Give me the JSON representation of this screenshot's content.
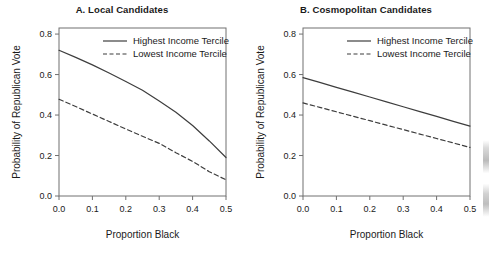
{
  "figure": {
    "panel_count": 2,
    "background_color": "#ffffff",
    "line_color": "#3d3d3d",
    "text_color": "#1a1a1a",
    "axis_color": "#707070"
  },
  "chart_data": [
    {
      "type": "line",
      "panel_label": "A",
      "title": "A. Local Candidates",
      "xlabel": "Proportion Black",
      "ylabel": "Probability of Republican Vote",
      "xlim": [
        0.0,
        0.5
      ],
      "ylim": [
        0.0,
        0.83
      ],
      "xticks": [
        0.0,
        0.1,
        0.2,
        0.3,
        0.4,
        0.5
      ],
      "xticklabels": [
        "0.0",
        "0.1",
        "0.2",
        "0.3",
        "0.4",
        "0.5"
      ],
      "yticks": [
        0.0,
        0.2,
        0.4,
        0.6,
        0.8
      ],
      "yticklabels": [
        "0.0",
        "0.2",
        "0.4",
        "0.6",
        "0.8"
      ],
      "grid": false,
      "legend_position": "top-right-inside",
      "x": [
        0.0,
        0.05,
        0.1,
        0.15,
        0.2,
        0.25,
        0.3,
        0.35,
        0.4,
        0.45,
        0.5
      ],
      "series": [
        {
          "name": "Highest Income Tercile",
          "style": "solid",
          "values": [
            0.72,
            0.685,
            0.648,
            0.608,
            0.566,
            0.522,
            0.469,
            0.414,
            0.348,
            0.272,
            0.19
          ]
        },
        {
          "name": "Lowest Income Tercile",
          "style": "dashed",
          "values": [
            0.478,
            0.442,
            0.405,
            0.368,
            0.331,
            0.295,
            0.26,
            0.214,
            0.171,
            0.12,
            0.08
          ]
        }
      ]
    },
    {
      "type": "line",
      "panel_label": "B",
      "title": "B. Cosmopolitan Candidates",
      "xlabel": "Proportion Black",
      "ylabel": "Probability of Republican Vote",
      "xlim": [
        0.0,
        0.5
      ],
      "ylim": [
        0.0,
        0.83
      ],
      "xticks": [
        0.0,
        0.1,
        0.2,
        0.3,
        0.4,
        0.5
      ],
      "xticklabels": [
        "0.0",
        "0.1",
        "0.2",
        "0.3",
        "0.4",
        "0.5"
      ],
      "yticks": [
        0.0,
        0.2,
        0.4,
        0.6,
        0.8
      ],
      "yticklabels": [
        "0.0",
        "0.2",
        "0.4",
        "0.6",
        "0.8"
      ],
      "grid": false,
      "legend_position": "top-right-inside",
      "x": [
        0.0,
        0.05,
        0.1,
        0.15,
        0.2,
        0.25,
        0.3,
        0.35,
        0.4,
        0.45,
        0.5
      ],
      "series": [
        {
          "name": "Highest Income Tercile",
          "style": "solid",
          "values": [
            0.585,
            0.561,
            0.537,
            0.513,
            0.489,
            0.465,
            0.441,
            0.417,
            0.393,
            0.369,
            0.345
          ]
        },
        {
          "name": "Lowest Income Tercile",
          "style": "dashed",
          "values": [
            0.46,
            0.438,
            0.416,
            0.394,
            0.372,
            0.35,
            0.328,
            0.306,
            0.284,
            0.262,
            0.24
          ]
        }
      ]
    }
  ]
}
